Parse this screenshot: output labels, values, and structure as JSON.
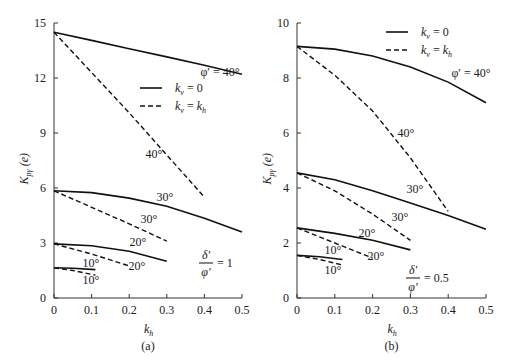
{
  "chart_data": [
    {
      "type": "line",
      "panel_label": "(a)",
      "xlabel": "k_h",
      "ylabel": "K_pγ (e)",
      "xlim": [
        0,
        0.5
      ],
      "ylim": [
        0,
        15
      ],
      "xticks": [
        "0",
        "0.1",
        "0.2",
        "0.3",
        "0.4",
        "0.5"
      ],
      "yticks": [
        "0",
        "3",
        "6",
        "9",
        "12",
        "15"
      ],
      "legend": [
        {
          "label": "k_v = 0",
          "style": "solid"
        },
        {
          "label": "k_v = k_h",
          "style": "dashed"
        }
      ],
      "annotation": "δ'/φ' = 1",
      "series": [
        {
          "name": "φ' = 40°, k_v = 0",
          "style": "solid",
          "x": [
            0,
            0.1,
            0.2,
            0.3,
            0.4,
            0.5
          ],
          "y": [
            14.5,
            14.05,
            13.6,
            13.15,
            12.7,
            12.2
          ],
          "label": "φ' = 40°"
        },
        {
          "name": "40°, k_v = k_h",
          "style": "dashed",
          "x": [
            0,
            0.1,
            0.2,
            0.3,
            0.4
          ],
          "y": [
            14.5,
            12.3,
            10.1,
            7.8,
            5.5
          ],
          "label": "40°"
        },
        {
          "name": "30°, k_v = 0",
          "style": "solid",
          "x": [
            0,
            0.1,
            0.2,
            0.3,
            0.4,
            0.5
          ],
          "y": [
            5.85,
            5.75,
            5.45,
            5.0,
            4.35,
            3.6
          ],
          "label": "30°"
        },
        {
          "name": "30°, k_v = k_h",
          "style": "dashed",
          "x": [
            0,
            0.1,
            0.2,
            0.3
          ],
          "y": [
            5.85,
            4.95,
            4.05,
            3.1
          ],
          "label": "30°"
        },
        {
          "name": "20°, k_v = 0",
          "style": "solid",
          "x": [
            0,
            0.1,
            0.2,
            0.3
          ],
          "y": [
            2.95,
            2.85,
            2.55,
            2.0
          ],
          "label": "20°"
        },
        {
          "name": "20°, k_v = k_h",
          "style": "dashed",
          "x": [
            0,
            0.1,
            0.2
          ],
          "y": [
            2.95,
            2.4,
            1.75
          ],
          "label": "20°"
        },
        {
          "name": "10°, k_v = 0",
          "style": "solid",
          "x": [
            0,
            0.05,
            0.11
          ],
          "y": [
            1.65,
            1.62,
            1.55
          ],
          "label": "10°"
        },
        {
          "name": "10°, k_v = k_h",
          "style": "dashed",
          "x": [
            0,
            0.05,
            0.11
          ],
          "y": [
            1.65,
            1.5,
            1.25
          ],
          "label": "10°"
        }
      ]
    },
    {
      "type": "line",
      "panel_label": "(b)",
      "xlabel": "k_h",
      "ylabel": "K_pγ (e)",
      "xlim": [
        0,
        0.5
      ],
      "ylim": [
        0,
        10
      ],
      "xticks": [
        "0",
        "0.1",
        "0.2",
        "0.3",
        "0.4",
        "0.5"
      ],
      "yticks": [
        "0",
        "2",
        "4",
        "6",
        "8",
        "10"
      ],
      "legend": [
        {
          "label": "k_v = 0",
          "style": "solid"
        },
        {
          "label": "k_v = k_h",
          "style": "dashed"
        }
      ],
      "annotation": "δ'/φ' = 0.5",
      "series": [
        {
          "name": "φ' = 40°, k_v = 0",
          "style": "solid",
          "x": [
            0,
            0.1,
            0.2,
            0.3,
            0.4,
            0.5
          ],
          "y": [
            9.15,
            9.05,
            8.8,
            8.4,
            7.85,
            7.1
          ],
          "label": "φ' = 40°"
        },
        {
          "name": "40°, k_v = k_h",
          "style": "dashed",
          "x": [
            0,
            0.1,
            0.2,
            0.3,
            0.4
          ],
          "y": [
            9.15,
            8.1,
            6.8,
            5.1,
            3.15
          ],
          "label": "40°"
        },
        {
          "name": "30°, k_v = 0",
          "style": "solid",
          "x": [
            0,
            0.1,
            0.2,
            0.3,
            0.4,
            0.5
          ],
          "y": [
            4.55,
            4.3,
            3.9,
            3.45,
            3.0,
            2.5
          ],
          "label": "30°"
        },
        {
          "name": "30°, k_v = k_h",
          "style": "dashed",
          "x": [
            0,
            0.1,
            0.2,
            0.3
          ],
          "y": [
            4.55,
            3.9,
            3.05,
            2.1
          ],
          "label": "30°"
        },
        {
          "name": "20°, k_v = 0",
          "style": "solid",
          "x": [
            0,
            0.1,
            0.2,
            0.3
          ],
          "y": [
            2.55,
            2.35,
            2.1,
            1.75
          ],
          "label": "20°"
        },
        {
          "name": "20°, k_v = k_h",
          "style": "dashed",
          "x": [
            0,
            0.1,
            0.2
          ],
          "y": [
            2.55,
            2.0,
            1.45
          ],
          "label": "20°"
        },
        {
          "name": "10°, k_v = 0",
          "style": "solid",
          "x": [
            0,
            0.06,
            0.12
          ],
          "y": [
            1.55,
            1.5,
            1.4
          ],
          "label": "10°"
        },
        {
          "name": "10°, k_v = k_h",
          "style": "dashed",
          "x": [
            0,
            0.06,
            0.12
          ],
          "y": [
            1.55,
            1.4,
            1.2
          ],
          "label": "10°"
        }
      ]
    }
  ],
  "panels": [
    {
      "geom": {
        "x0": 54,
        "x1": 242,
        "y0": 298,
        "y1": 23
      },
      "label_pos": [
        {
          "x": 220,
          "y": 76,
          "text": "φ′ = 40°"
        },
        {
          "x": 154,
          "y": 158,
          "text": "40°"
        },
        {
          "x": 165,
          "y": 201,
          "text": "30°"
        },
        {
          "x": 149,
          "y": 223,
          "text": "30°"
        },
        {
          "x": 138,
          "y": 246,
          "text": "20°"
        },
        {
          "x": 137,
          "y": 270,
          "text": "20°"
        },
        {
          "x": 91,
          "y": 267,
          "text": "10°"
        },
        {
          "x": 91,
          "y": 284,
          "text": "10°"
        }
      ],
      "legend_pos": {
        "x": 140,
        "y": 88
      },
      "ratio": {
        "x": 206,
        "y": 265,
        "num": "δ′",
        "den": "φ′",
        "eq": "= 1"
      }
    },
    {
      "geom": {
        "x0": 297,
        "x1": 486,
        "y0": 298,
        "y1": 23
      },
      "label_pos": [
        {
          "x": 471,
          "y": 77,
          "text": "φ′ = 40°"
        },
        {
          "x": 406,
          "y": 137,
          "text": "40°"
        },
        {
          "x": 415,
          "y": 193,
          "text": "30°"
        },
        {
          "x": 400,
          "y": 221,
          "text": "30°"
        },
        {
          "x": 367,
          "y": 237,
          "text": "20°"
        },
        {
          "x": 376,
          "y": 260,
          "text": "20°"
        },
        {
          "x": 333,
          "y": 254,
          "text": "10°"
        },
        {
          "x": 333,
          "y": 274,
          "text": "10°"
        }
      ],
      "legend_pos": {
        "x": 386,
        "y": 32
      },
      "ratio": {
        "x": 413,
        "y": 280,
        "num": "δ′",
        "den": "φ′",
        "eq": "= 0.5"
      }
    }
  ]
}
